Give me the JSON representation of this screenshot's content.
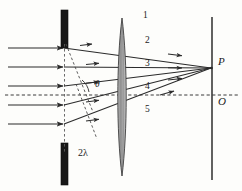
{
  "figure": {
    "colors": {
      "ink": "#2b2b2b",
      "barrier": "#171717",
      "lens_fill": "#9a9a9a",
      "lens_stroke": "#3a3a3a",
      "dashed": "#4a4a4a",
      "background": "#fdfdfb"
    },
    "elements": {
      "grating_label": "",
      "lens_label": "",
      "screen_label": ""
    },
    "ray_labels": [
      {
        "text": "1",
        "x": 143,
        "y": 16
      },
      {
        "text": "2",
        "x": 145,
        "y": 41
      },
      {
        "text": "3",
        "x": 145,
        "y": 64
      },
      {
        "text": "4",
        "x": 145,
        "y": 87
      },
      {
        "text": "5",
        "x": 145,
        "y": 110
      }
    ],
    "point_labels": [
      {
        "text": "P",
        "x": 218,
        "y": 61
      },
      {
        "text": "O",
        "x": 218,
        "y": 101
      }
    ],
    "annotations": [
      {
        "text": "2λ",
        "x": 78,
        "y": 151
      },
      {
        "text": "θ",
        "x": 96,
        "y": 82
      }
    ],
    "incoming_rays": {
      "count": 5,
      "start_x": 8,
      "end_x": 64,
      "y_positions": [
        48,
        67,
        86,
        105,
        124
      ]
    },
    "diffracted_rays": {
      "count": 5,
      "origin_x": 64,
      "origin_y_positions": [
        48,
        67,
        86,
        105,
        124
      ],
      "converge_x": 212,
      "converge_y": 68
    },
    "barrier": {
      "x": 64,
      "top_segment": [
        10,
        48
      ],
      "bottom_segment": [
        124,
        185
      ],
      "width": 7
    },
    "lens": {
      "center_x": 122,
      "top_y": 18,
      "bottom_y": 176,
      "max_half_width": 5
    },
    "screen": {
      "x": 212,
      "top_y": 17,
      "bottom_y": 180
    },
    "optical_axis": {
      "y": 95,
      "from_x": 5,
      "to_x": 238
    },
    "grating_normal_dashed": {
      "x": 64,
      "top_y": 44,
      "bottom_y": 152
    },
    "wavefront_dashed": [
      {
        "x1": 72,
        "y1": 44,
        "x2": 92,
        "y2": 108
      },
      {
        "x1": 82,
        "y1": 88,
        "x2": 98,
        "y2": 140
      }
    ]
  }
}
